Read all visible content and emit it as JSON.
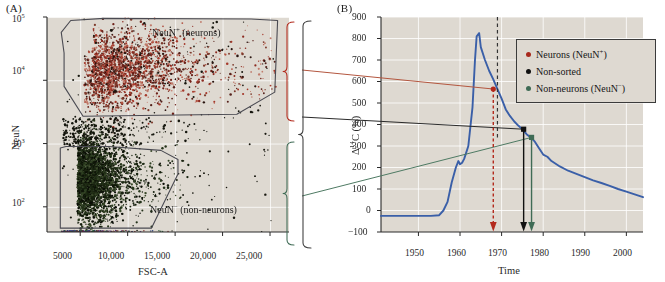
{
  "figure": {
    "panels": [
      {
        "id": "A",
        "label": "(A)"
      },
      {
        "id": "B",
        "label": "(B)"
      }
    ]
  },
  "panelA": {
    "label": "(A)",
    "type": "scatter",
    "ylabel": "NeuN",
    "xlabel": "FSC-A",
    "yticks": [
      "10",
      "10",
      "10",
      "10"
    ],
    "ytick_exponents": [
      "2",
      "3",
      "4",
      "5"
    ],
    "ytick_values": [
      100,
      1000,
      10000,
      100000
    ],
    "xticks": [
      "5000",
      "10,000",
      "15,000",
      "20,000",
      "25,000"
    ],
    "xtick_values": [
      5000,
      10000,
      15000,
      20000,
      25000
    ],
    "xlim": [
      1500,
      27000
    ],
    "ylim": [
      40,
      100000
    ],
    "gates": [
      {
        "name": "neurons-gate",
        "label": "NeuN",
        "superscript": "+",
        "suffix": " (neurons)"
      },
      {
        "name": "non-neurons-gate",
        "label": "NeuN",
        "superscript": "−",
        "suffix": " (non-neurons)"
      }
    ],
    "colors": {
      "background": "#ded9d1",
      "gate_outline": "#4a4a52",
      "neuron_points": "#8f2b22",
      "non_neuron_points": "#1c2a12"
    }
  },
  "panelB": {
    "label": "(B)",
    "ylabel": "Δ",
    "ylabel_sup": "14",
    "ylabel_rest": "C (%)",
    "xlabel": "Time",
    "yticks": [
      "900",
      "800",
      "700",
      "600",
      "500",
      "400",
      "300",
      "200",
      "100",
      "0",
      "−100"
    ],
    "ytick_values": [
      900,
      800,
      700,
      600,
      500,
      400,
      300,
      200,
      100,
      0,
      -100
    ],
    "xticks": [
      "1950",
      "1960",
      "1970",
      "1980",
      "1990",
      "2000"
    ],
    "xtick_values": [
      1950,
      1960,
      1970,
      1980,
      1990,
      2000
    ],
    "xlim": [
      1941,
      2004
    ],
    "ylim": [
      -100,
      900
    ],
    "colors": {
      "background": "#ded9d1",
      "curve": "#3a5fa8",
      "neurons": "#b3291c",
      "non_sorted": "#111111",
      "non_neurons": "#3f6b55"
    }
  },
  "legend": {
    "name": "bomb-curve-legend",
    "items": [
      {
        "label": "Neurons (NeuN",
        "sup": "+",
        "close": ")",
        "color": "#a8291c",
        "name": "legend-neurons"
      },
      {
        "label": "Non-sorted",
        "sup": "",
        "close": "",
        "color": "#111111",
        "name": "legend-non-sorted"
      },
      {
        "label": "Non-neurons (NeuN",
        "sup": "−",
        "close": ")",
        "color": "#3f6b55",
        "name": "legend-non-neurons"
      }
    ]
  },
  "chart_data": [
    {
      "type": "scatter",
      "name": "panel-A-flow-cytometry",
      "title": "",
      "xlabel": "FSC-A",
      "ylabel": "NeuN",
      "xlim": [
        1500,
        27000
      ],
      "ylim": [
        40,
        100000
      ],
      "yscale": "log",
      "grid": true,
      "xticks": [
        5000,
        10000,
        15000,
        20000,
        25000
      ],
      "xtick_labels": [
        "5000",
        "10,000",
        "15,000",
        "20,000",
        "25,000"
      ],
      "yticks": [
        100,
        1000,
        10000,
        100000
      ],
      "ytick_labels": [
        "10^2",
        "10^3",
        "10^4",
        "10^5"
      ],
      "annotations": [
        {
          "text": "NeuN+ (neurons)",
          "x": 13500,
          "y": 62000
        },
        {
          "text": "NeuN- (non-neurons)",
          "x": 12500,
          "y": 130
        }
      ],
      "series": [
        {
          "name": "NeuN+ (neurons)",
          "color": "#8f2b22",
          "n_points": 1400,
          "cluster_center_x": 8500,
          "cluster_center_y": 17000,
          "spread_x": 4600,
          "spread_y_log": 0.3
        },
        {
          "name": "NeuN- (non-neurons)",
          "color": "#1c2a12",
          "n_points": 2600,
          "cluster_center_x": 5600,
          "cluster_center_y": 280,
          "spread_x": 1700,
          "spread_y_log": 0.34
        },
        {
          "name": "intermediate / debris",
          "color": "#15150f",
          "n_points": 330,
          "cluster_center_x": 6500,
          "cluster_center_y": 1500,
          "spread_x": 3200,
          "spread_y_log": 0.22
        }
      ],
      "gate_polygons": [
        {
          "name": "neurons-gate",
          "points": [
            [
              3300,
              27000
            ],
            [
              3000,
              57000
            ],
            [
              4000,
              88000
            ],
            [
              7500,
              95000
            ],
            [
              23000,
              93000
            ],
            [
              25800,
              88000
            ],
            [
              25500,
              6500
            ],
            [
              21500,
              2900
            ],
            [
              5300,
              2700
            ],
            [
              3300,
              8000
            ]
          ]
        },
        {
          "name": "non-neurons-gate",
          "points": [
            [
              2900,
              850
            ],
            [
              2900,
              46
            ],
            [
              12500,
              46
            ],
            [
              15300,
              330
            ],
            [
              15300,
              560
            ],
            [
              13500,
              780
            ],
            [
              8000,
              900
            ],
            [
              3500,
              900
            ]
          ]
        }
      ]
    },
    {
      "type": "line",
      "name": "panel-B-bomb-curve",
      "title": "",
      "xlabel": "Time",
      "ylabel": "Δ14C (%)",
      "xlim": [
        1941,
        2004
      ],
      "ylim": [
        -100,
        900
      ],
      "grid": true,
      "xticks": [
        1950,
        1960,
        1970,
        1980,
        1990,
        2000
      ],
      "yticks": [
        -100,
        0,
        100,
        200,
        300,
        400,
        500,
        600,
        700,
        800,
        900
      ],
      "series": [
        {
          "name": "Atmospheric 14C bomb curve",
          "color": "#3a5fa8",
          "x": [
            1941,
            1945,
            1950,
            1953,
            1955,
            1956,
            1957,
            1958,
            1959,
            1959.6,
            1960,
            1960.5,
            1961,
            1962,
            1963,
            1963.6,
            1964,
            1964.6,
            1965,
            1966,
            1967,
            1968,
            1969,
            1970,
            1971,
            1972,
            1973,
            1974,
            1975,
            1976,
            1977,
            1978,
            1979,
            1980,
            1981,
            1982,
            1984,
            1986,
            1988,
            1990,
            1992,
            1994,
            1996,
            1998,
            2000,
            2002,
            2004
          ],
          "y": [
            -25,
            -25,
            -25,
            -25,
            -22,
            0,
            40,
            130,
            200,
            230,
            215,
            222,
            240,
            300,
            480,
            700,
            810,
            825,
            760,
            700,
            650,
            610,
            565,
            520,
            470,
            440,
            415,
            395,
            378,
            355,
            340,
            320,
            290,
            260,
            250,
            230,
            205,
            185,
            170,
            155,
            140,
            128,
            115,
            100,
            88,
            75,
            62
          ]
        }
      ],
      "data_points": [
        {
          "name": "Neurons (NeuN+)",
          "x": 1968.0,
          "y": 565,
          "color": "#b3291c",
          "marker": "circle",
          "arrow": "dashed-down"
        },
        {
          "name": "Non-sorted",
          "x": 1975.3,
          "y": 378,
          "color": "#111111",
          "marker": "square",
          "arrow": "solid-down"
        },
        {
          "name": "Non-neurons (NeuN-)",
          "x": 1977.2,
          "y": 340,
          "color": "#3f6b55",
          "marker": "square",
          "arrow": "solid-down"
        }
      ],
      "reference_line": {
        "name": "sampling-year-dashed",
        "x": 1969.0,
        "style": "dashed",
        "color": "#333333"
      },
      "legend": {
        "position": "upper-right",
        "entries": [
          "Neurons (NeuN+)",
          "Non-sorted",
          "Non-neurons (NeuN−)"
        ]
      }
    }
  ],
  "connectors": {
    "braces": [
      {
        "name": "brace-neurons",
        "color": "#b3291c"
      },
      {
        "name": "brace-non-neurons",
        "color": "#3f6b55"
      },
      {
        "name": "brace-non-sorted",
        "color": "#3b3b3b"
      }
    ]
  }
}
